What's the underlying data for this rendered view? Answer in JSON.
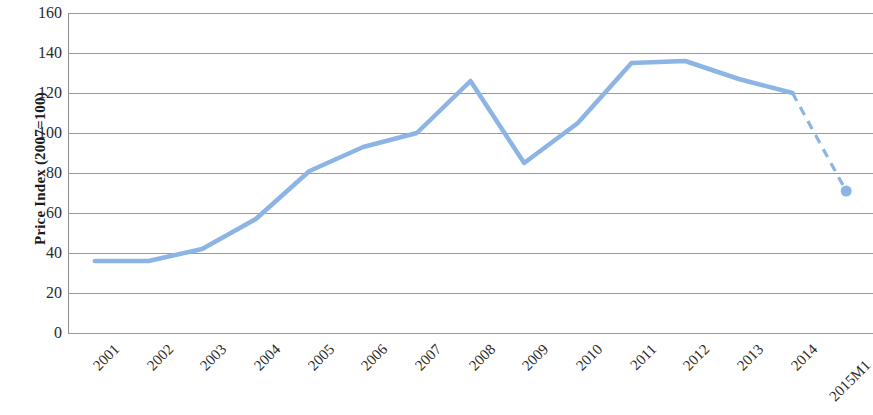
{
  "chart_data": {
    "type": "line",
    "title": "",
    "subtitle": "",
    "xlabel": "",
    "ylabel": "Price Index (2007=100)",
    "categories": [
      "2001",
      "2002",
      "2003",
      "2004",
      "2005",
      "2006",
      "2007",
      "2008",
      "2009",
      "2010",
      "2011",
      "2012",
      "2013",
      "2014",
      "2015M1"
    ],
    "values": [
      36,
      36,
      42,
      57,
      81,
      93,
      100,
      126,
      85,
      105,
      135,
      136,
      127,
      120,
      71
    ],
    "series": [
      {
        "name": "Price Index",
        "values": [
          36,
          36,
          42,
          57,
          81,
          93,
          100,
          126,
          85,
          105,
          135,
          136,
          127,
          120,
          71
        ],
        "color": "#8CB4E4",
        "solid_through_index": 13,
        "dashed_from_index": 13,
        "marker_indices": [
          14
        ]
      }
    ],
    "ylim": [
      0,
      160
    ],
    "yticks": [
      0,
      20,
      40,
      60,
      80,
      100,
      120,
      140,
      160
    ],
    "ytick_labels": [
      "0",
      "20",
      "40",
      "60",
      "80",
      "100",
      "120",
      "140",
      "160"
    ],
    "grid": true,
    "grid_axis": "y",
    "legend": false,
    "legend_position": "none",
    "annotations": [],
    "line_color": "#8CB4E4",
    "grid_color": "#9a9a9a",
    "background": "#ffffff",
    "xtick_rotation": -45
  }
}
